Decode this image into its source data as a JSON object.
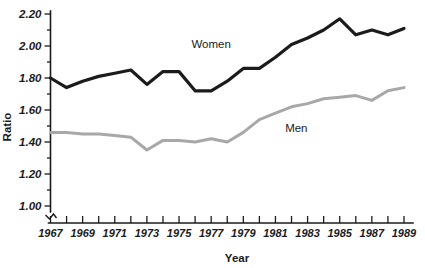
{
  "chart_data": {
    "type": "line",
    "title": "",
    "xlabel": "Year",
    "ylabel": "Ratio",
    "xlim": [
      1967,
      1989
    ],
    "ylim": [
      1.0,
      2.2
    ],
    "y_ticks": [
      "1.00",
      "1.20",
      "1.40",
      "1.60",
      "1.80",
      "2.00",
      "2.20"
    ],
    "y_tick_values": [
      1.0,
      1.2,
      1.4,
      1.6,
      1.8,
      2.0,
      2.2
    ],
    "x_tick_labels": [
      "1967",
      "1969",
      "1971",
      "1973",
      "1975",
      "1977",
      "1979",
      "1981",
      "1983",
      "1985",
      "1987",
      "1989"
    ],
    "x_tick_values": [
      1967,
      1969,
      1971,
      1973,
      1975,
      1977,
      1979,
      1981,
      1983,
      1985,
      1987,
      1989
    ],
    "grid": false,
    "legend_position": "inline-annotation",
    "axis_break": true,
    "x": [
      1967,
      1968,
      1969,
      1970,
      1971,
      1972,
      1973,
      1974,
      1975,
      1976,
      1977,
      1978,
      1979,
      1980,
      1981,
      1982,
      1983,
      1984,
      1985,
      1986,
      1987,
      1988,
      1989
    ],
    "series": [
      {
        "name": "Women",
        "color": "#1b1b1b",
        "values": [
          1.8,
          1.74,
          1.78,
          1.81,
          1.83,
          1.85,
          1.76,
          1.84,
          1.84,
          1.72,
          1.72,
          1.78,
          1.86,
          1.86,
          1.93,
          2.01,
          2.05,
          2.1,
          2.17,
          2.07,
          2.1,
          2.07,
          2.11
        ],
        "label_text": "Women"
      },
      {
        "name": "Men",
        "color": "#a8a8a8",
        "values": [
          1.46,
          1.46,
          1.45,
          1.45,
          1.44,
          1.43,
          1.35,
          1.41,
          1.41,
          1.4,
          1.42,
          1.4,
          1.46,
          1.54,
          1.58,
          1.62,
          1.64,
          1.67,
          1.68,
          1.69,
          1.66,
          1.72,
          1.74
        ],
        "label_text": "Men"
      }
    ],
    "annotations": [
      {
        "text": "Women",
        "x": 1977.0,
        "y": 1.99
      },
      {
        "text": "Men",
        "x": 1982.3,
        "y": 1.46
      }
    ]
  }
}
